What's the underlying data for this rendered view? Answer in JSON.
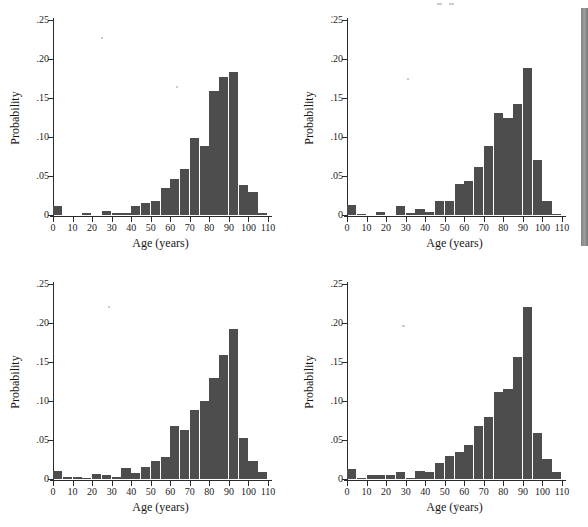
{
  "figure": {
    "background": "#ffffff",
    "bar_color": "#4d4d4d",
    "axis_color": "#2b2b2b",
    "panel_count": 4
  },
  "chart_data": [
    {
      "type": "bar",
      "title": "",
      "xlabel": "Age (years)",
      "ylabel": "Probability",
      "xlim": [
        0,
        110
      ],
      "ylim": [
        0,
        0.25
      ],
      "xticks": [
        0,
        10,
        20,
        30,
        40,
        50,
        60,
        70,
        80,
        90,
        100,
        110
      ],
      "xticklabels": [
        "0",
        "10",
        "20",
        "30",
        "40",
        "50",
        "60",
        "70",
        "80",
        "90",
        "100",
        "110"
      ],
      "yticks": [
        0,
        0.05,
        0.1,
        0.15,
        0.2,
        0.25
      ],
      "yticklabels": [
        "0",
        ".05",
        ".10",
        ".15",
        ".20",
        ".25"
      ],
      "grid": false,
      "legend": "none",
      "bin_width": 5,
      "categories": [
        0,
        5,
        10,
        15,
        20,
        25,
        30,
        35,
        40,
        45,
        50,
        55,
        60,
        65,
        70,
        75,
        80,
        85,
        90,
        95,
        100,
        105
      ],
      "values": [
        0.011,
        0.0,
        0.0,
        0.002,
        0.0,
        0.005,
        0.002,
        0.002,
        0.012,
        0.015,
        0.018,
        0.035,
        0.046,
        0.059,
        0.099,
        0.089,
        0.159,
        0.177,
        0.183,
        0.038,
        0.029,
        0.002
      ]
    },
    {
      "type": "bar",
      "title": "",
      "xlabel": "Age (years)",
      "ylabel": "Probability",
      "xlim": [
        0,
        110
      ],
      "ylim": [
        0,
        0.25
      ],
      "xticks": [
        0,
        10,
        20,
        30,
        40,
        50,
        60,
        70,
        80,
        90,
        100,
        110
      ],
      "xticklabels": [
        "0",
        "10",
        "20",
        "30",
        "40",
        "50",
        "60",
        "70",
        "80",
        "90",
        "100",
        "110"
      ],
      "yticks": [
        0,
        0.05,
        0.1,
        0.15,
        0.2,
        0.25
      ],
      "yticklabels": [
        "0",
        ".05",
        ".10",
        ".15",
        ".20",
        ".25"
      ],
      "grid": false,
      "legend": "none",
      "bin_width": 5,
      "categories": [
        0,
        5,
        10,
        15,
        20,
        25,
        30,
        35,
        40,
        45,
        50,
        55,
        60,
        65,
        70,
        75,
        80,
        85,
        90,
        95,
        100,
        105
      ],
      "values": [
        0.013,
        0.001,
        0.0,
        0.004,
        0.0,
        0.011,
        0.003,
        0.008,
        0.004,
        0.018,
        0.018,
        0.04,
        0.043,
        0.061,
        0.088,
        0.131,
        0.125,
        0.142,
        0.189,
        0.07,
        0.018,
        0.001
      ]
    },
    {
      "type": "bar",
      "title": "",
      "xlabel": "Age (years)",
      "ylabel": "Probability",
      "xlim": [
        0,
        110
      ],
      "ylim": [
        0,
        0.25
      ],
      "xticks": [
        0,
        10,
        20,
        30,
        40,
        50,
        60,
        70,
        80,
        90,
        100,
        110
      ],
      "xticklabels": [
        "0",
        "10",
        "20",
        "30",
        "40",
        "50",
        "60",
        "70",
        "80",
        "90",
        "100",
        "110"
      ],
      "yticks": [
        0,
        0.05,
        0.1,
        0.15,
        0.2,
        0.25
      ],
      "yticklabels": [
        "0",
        ".05",
        ".10",
        ".15",
        ".20",
        ".25"
      ],
      "grid": false,
      "legend": "none",
      "bin_width": 5,
      "categories": [
        0,
        5,
        10,
        15,
        20,
        25,
        30,
        35,
        40,
        45,
        50,
        55,
        60,
        65,
        70,
        75,
        80,
        85,
        90,
        95,
        100,
        105
      ],
      "values": [
        0.01,
        0.003,
        0.003,
        0.001,
        0.007,
        0.005,
        0.002,
        0.014,
        0.008,
        0.015,
        0.023,
        0.028,
        0.068,
        0.063,
        0.089,
        0.1,
        0.129,
        0.159,
        0.192,
        0.053,
        0.023,
        0.009
      ]
    },
    {
      "type": "bar",
      "title": "",
      "xlabel": "Age (years)",
      "ylabel": "Probability",
      "xlim": [
        0,
        110
      ],
      "ylim": [
        0,
        0.25
      ],
      "xticks": [
        0,
        10,
        20,
        30,
        40,
        50,
        60,
        70,
        80,
        90,
        100,
        110
      ],
      "xticklabels": [
        "0",
        "10",
        "20",
        "30",
        "40",
        "50",
        "60",
        "70",
        "80",
        "90",
        "100",
        "110"
      ],
      "yticks": [
        0,
        0.05,
        0.1,
        0.15,
        0.2,
        0.25
      ],
      "yticklabels": [
        "0",
        ".05",
        ".10",
        ".15",
        ".20",
        ".25"
      ],
      "grid": false,
      "legend": "none",
      "bin_width": 5,
      "categories": [
        0,
        5,
        10,
        15,
        20,
        25,
        30,
        35,
        40,
        45,
        50,
        55,
        60,
        65,
        70,
        75,
        80,
        85,
        90,
        95,
        100,
        105
      ],
      "values": [
        0.013,
        0.001,
        0.005,
        0.005,
        0.005,
        0.009,
        0.001,
        0.01,
        0.009,
        0.02,
        0.029,
        0.035,
        0.043,
        0.068,
        0.079,
        0.112,
        0.115,
        0.157,
        0.22,
        0.059,
        0.026,
        0.009
      ]
    }
  ]
}
